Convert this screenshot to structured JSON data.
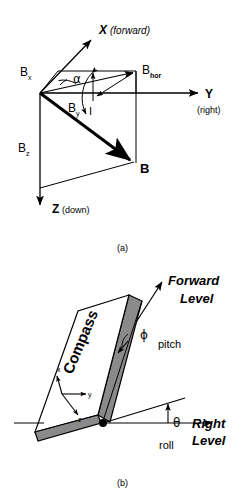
{
  "figure": {
    "title_a": "(a)",
    "title_b": "(b)",
    "panel_a": {
      "name": "earth-magnetic-field-vector-diagram",
      "labels": {
        "axis_x": "X",
        "axis_x_note": "(forward)",
        "axis_y": "Y",
        "axis_y_note": "(right)",
        "axis_z": "Z",
        "axis_z_note": "(down)",
        "bx": "B",
        "bx_sub": "x",
        "by": "B",
        "by_sub": "y",
        "bz": "B",
        "bz_sub": "z",
        "bhor": "B",
        "bhor_sub": "hor",
        "b_total": "B",
        "angle_alpha": "α",
        "angle_inclination": "I"
      }
    },
    "panel_b": {
      "name": "compass-orientation-pitch-roll-diagram",
      "labels": {
        "board": "Compass",
        "forward": "Forward",
        "level_forward": "Level",
        "pitch": "pitch",
        "angle_phi": "ϕ",
        "right": "Right",
        "level_right": "Level",
        "roll": "roll",
        "angle_theta": "θ",
        "triad_x": "x",
        "triad_y": "y",
        "triad_z": "z"
      }
    },
    "colors": {
      "stroke": "#000000",
      "board_face": "#ffffff",
      "board_edge_shade": "#8a8a8a",
      "background": "#ffffff"
    }
  }
}
